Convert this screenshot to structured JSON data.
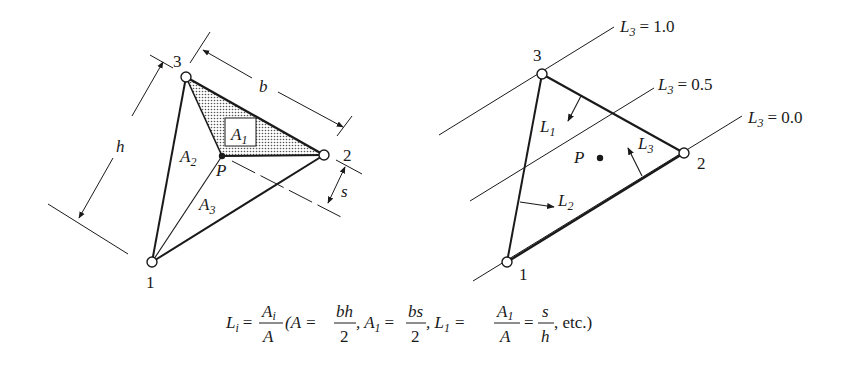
{
  "left_diagram": {
    "nodes": [
      {
        "id": "1",
        "label": "1",
        "x": 152,
        "y": 262
      },
      {
        "id": "2",
        "label": "2",
        "x": 324,
        "y": 155
      },
      {
        "id": "3",
        "label": "3",
        "x": 186,
        "y": 77
      }
    ],
    "point": {
      "label": "P",
      "x": 222,
      "y": 156
    },
    "areas": {
      "a1": "A",
      "a1_sub": "1",
      "a2": "A",
      "a2_sub": "2",
      "a3": "A",
      "a3_sub": "3"
    },
    "dimensions": {
      "base": "b",
      "height": "h",
      "distance": "s"
    }
  },
  "right_diagram": {
    "nodes": [
      {
        "id": "1",
        "label": "1",
        "x": 507,
        "y": 262
      },
      {
        "id": "2",
        "label": "2",
        "x": 684,
        "y": 153
      },
      {
        "id": "3",
        "label": "3",
        "x": 542,
        "y": 74
      }
    ],
    "point": {
      "label": "P",
      "x": 600,
      "y": 158
    },
    "coords": {
      "l1": "L",
      "l1_sub": "1",
      "l2": "L",
      "l2_sub": "2",
      "l3": "L",
      "l3_sub": "3"
    },
    "level_lines": [
      {
        "label": "L",
        "sub": "3",
        "value": "= 1.0"
      },
      {
        "label": "L",
        "sub": "3",
        "value": "= 0.5"
      },
      {
        "label": "L",
        "sub": "3",
        "value": "= 0.0"
      }
    ]
  },
  "formula": {
    "lhs": "L",
    "lhs_sub": "i",
    "frac1_num": "A",
    "frac1_num_sub": "i",
    "frac1_den": "A",
    "part1": "(A =",
    "frac2_num": "bh",
    "frac2_den": "2",
    "part2": ", A",
    "part2_sub": "1",
    "part2_eq": "=",
    "frac3_num": "bs",
    "frac3_den": "2",
    "part3": ", L",
    "part3_sub": "1",
    "part3_eq": "=",
    "frac4_num": "A",
    "frac4_num_sub": "1",
    "frac4_den": "A",
    "frac5_num": "s",
    "frac5_den": "h",
    "tail": ", etc.)"
  }
}
